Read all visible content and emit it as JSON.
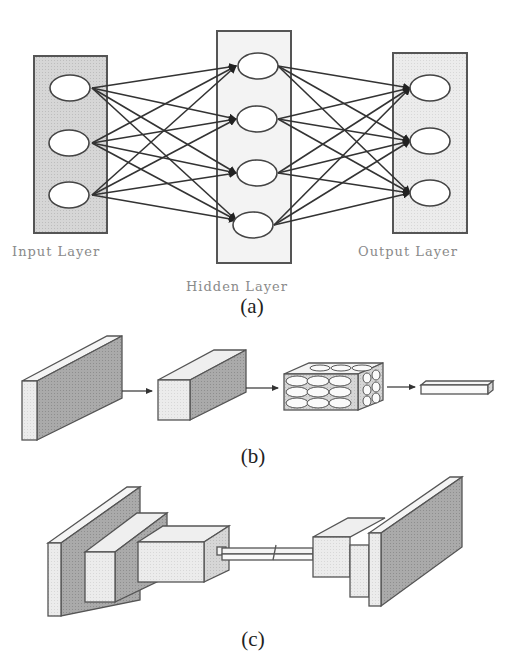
{
  "figure": {
    "panels": [
      {
        "id": "a",
        "caption": "(a)",
        "title": "Fully connected neural network",
        "layers": [
          {
            "name": "input",
            "label": "Input Layer",
            "nodes": 3
          },
          {
            "name": "hidden",
            "label": "Hidden Layer",
            "nodes": 4
          },
          {
            "name": "output",
            "label": "Output Layer",
            "nodes": 3
          }
        ]
      },
      {
        "id": "b",
        "caption": "(b)",
        "title": "Convolutional pipeline",
        "blocks": [
          "thin slab",
          "deep block",
          "honeycomb feature block",
          "flat vector"
        ]
      },
      {
        "id": "c",
        "caption": "(c)",
        "title": "Encoder-decoder (autoencoder) structure",
        "blocks": [
          "encoder slab",
          "encoder block 1",
          "encoder block 2",
          "bottleneck",
          "decoder block 1",
          "decoder block 2",
          "decoder slab"
        ]
      }
    ]
  },
  "colors": {
    "box_fill_light": "#e4e4e4",
    "box_fill_mid": "#c8c8c8",
    "box_fill_dark": "#a9a9a9",
    "stroke": "#444444",
    "edge": "#3a3a3a",
    "label_gray": "#8a8a8a"
  }
}
